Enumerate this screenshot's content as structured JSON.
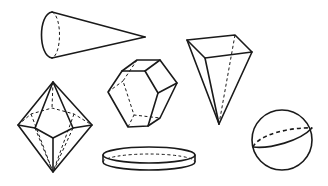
{
  "figure": {
    "background": "#ffffff",
    "stroke_color": "#1a1a1a",
    "shapes": [
      {
        "id": "cone",
        "name": "Cone",
        "orientation": "lying on side, apex pointing right"
      },
      {
        "id": "inverted-pyramid",
        "name": "Square pyramid",
        "orientation": "inverted, apex down"
      },
      {
        "id": "hexagonal-prism",
        "name": "Hexagonal prism"
      },
      {
        "id": "octahedron",
        "name": "Pentagonal bipyramid / octahedron-like solid"
      },
      {
        "id": "disc",
        "name": "Cylinder (flat disc)"
      },
      {
        "id": "sphere",
        "name": "Sphere",
        "detail": "with equatorial ellipse"
      }
    ]
  }
}
